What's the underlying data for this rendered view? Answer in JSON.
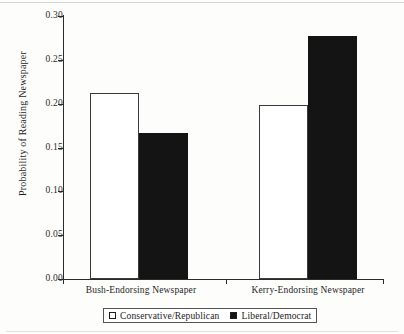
{
  "chart_data": {
    "type": "bar",
    "title": "",
    "subtitle": "",
    "xlabel": "",
    "ylabel": "Probability of Reading Newspaper",
    "categories": [
      "Bush-Endorsing Newspaper",
      "Kerry-Endorsing Newspaper"
    ],
    "series": [
      {
        "name": "Conservative/Republican",
        "style": "open",
        "color": "#ffffff",
        "edge_color": "#3a3a3a",
        "values": [
          0.212,
          0.199
        ]
      },
      {
        "name": "Liberal/Democrat",
        "style": "filled",
        "color": "#141414",
        "edge_color": "#141414",
        "values": [
          0.166,
          0.277
        ]
      }
    ],
    "ylim": [
      0.0,
      0.3
    ],
    "ytick_values": [
      0.3,
      0.25,
      0.2,
      0.15,
      0.1,
      0.05,
      0.0
    ],
    "ytick_labels": [
      "0.30",
      "0.25",
      "0.20",
      "0.15",
      "0.10",
      "0.05",
      "0.00"
    ],
    "grid": false,
    "legend_position": "bottom-center"
  },
  "legend": {
    "entries": [
      {
        "label": "Conservative/Republican",
        "swatch": "open-square-icon"
      },
      {
        "label": "Liberal/Democrat",
        "swatch": "filled-square-icon"
      }
    ]
  },
  "axes": {
    "y_title": "Probability of Reading Newspaper",
    "y_ticks": [
      {
        "label": "0.30",
        "value": 0.3
      },
      {
        "label": "0.25",
        "value": 0.25
      },
      {
        "label": "0.20",
        "value": 0.2
      },
      {
        "label": "0.15",
        "value": 0.15
      },
      {
        "label": "0.10",
        "value": 0.1
      },
      {
        "label": "0.05",
        "value": 0.05
      },
      {
        "label": "0.00",
        "value": 0.0
      }
    ],
    "x_groups": [
      {
        "label": "Bush-Endorsing Newspaper"
      },
      {
        "label": "Kerry-Endorsing Newspaper"
      }
    ]
  }
}
